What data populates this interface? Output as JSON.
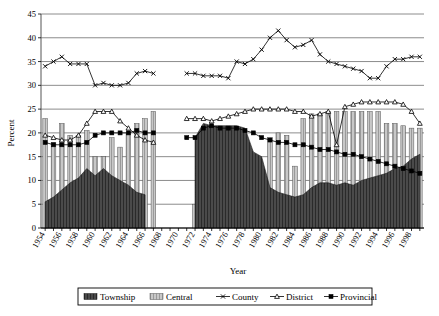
{
  "axes": {
    "y_title": "Percent",
    "x_title": "Year",
    "y_ticks": [
      "0",
      "5",
      "10",
      "15",
      "20",
      "25",
      "30",
      "35",
      "40",
      "45"
    ],
    "x_ticks": [
      "1954",
      "1956",
      "1958",
      "1960",
      "1962",
      "1964",
      "1966",
      "1968",
      "1970",
      "1972",
      "1974",
      "1976",
      "1978",
      "1980",
      "1982",
      "1984",
      "1986",
      "1988",
      "1990",
      "1992",
      "1994",
      "1996",
      "1998"
    ]
  },
  "legend": {
    "items": [
      {
        "label": "Township",
        "marker": "area-dark-swatch",
        "color": "#3a3a3a"
      },
      {
        "label": "Central",
        "marker": "bar-light-swatch",
        "color": "#bfbfbf"
      },
      {
        "label": "County",
        "marker": "line-x-marker",
        "color": "#000000"
      },
      {
        "label": "District",
        "marker": "line-triangle-marker",
        "color": "#000000"
      },
      {
        "label": "Provincial",
        "marker": "line-square-marker",
        "color": "#000000"
      }
    ]
  },
  "chart_data": {
    "type": "line",
    "title": "",
    "xlabel": "Year",
    "ylabel": "Percent",
    "xlim": [
      1954,
      1999
    ],
    "ylim": [
      0,
      45
    ],
    "ytick_step": 5,
    "grid": "horizontal",
    "legend_position": "bottom",
    "note": "Series are plotted against years 1954-1999. Township is a dark filled area series, Central is light grey vertical bars, County/District/Provincial are marker lines. Data is missing (gap) between 1966 and 1970.",
    "x": [
      1954,
      1955,
      1956,
      1957,
      1958,
      1959,
      1960,
      1961,
      1962,
      1963,
      1964,
      1965,
      1966,
      1967,
      1968,
      1969,
      1970,
      1971,
      1972,
      1973,
      1974,
      1975,
      1976,
      1977,
      1978,
      1979,
      1980,
      1981,
      1982,
      1983,
      1984,
      1985,
      1986,
      1987,
      1988,
      1989,
      1990,
      1991,
      1992,
      1993,
      1994,
      1995,
      1996,
      1997,
      1998,
      1999
    ],
    "series": [
      {
        "name": "Township",
        "type": "area",
        "color": "#3a3a3a",
        "values": [
          5.5,
          6.5,
          8.0,
          9.5,
          10.5,
          12.5,
          11.0,
          12.5,
          11.0,
          10.0,
          9.0,
          7.5,
          7.0,
          null,
          null,
          null,
          null,
          null,
          19.0,
          22.0,
          21.5,
          21.5,
          21.5,
          21.5,
          21.0,
          16.0,
          15.0,
          8.5,
          7.5,
          7.0,
          6.5,
          7.0,
          8.5,
          9.5,
          9.5,
          9.0,
          9.5,
          9.0,
          10.0,
          10.5,
          11.0,
          11.5,
          12.5,
          13.0,
          14.5,
          15.5
        ]
      },
      {
        "name": "Central",
        "type": "bar",
        "color": "#bfbfbf",
        "values": [
          23.0,
          18.0,
          22.0,
          19.5,
          19.5,
          20.5,
          15.0,
          15.0,
          19.0,
          17.0,
          20.0,
          22.0,
          23.0,
          24.5,
          null,
          null,
          null,
          null,
          5.0,
          5.0,
          5.0,
          5.0,
          5.0,
          5.0,
          5.0,
          13.0,
          9.0,
          19.0,
          20.0,
          19.5,
          13.0,
          23.0,
          24.0,
          24.0,
          24.5,
          24.5,
          24.5,
          24.5,
          24.5,
          24.5,
          24.5,
          22.0,
          22.0,
          21.5,
          21.0,
          21.0
        ]
      },
      {
        "name": "County",
        "type": "line",
        "marker": "x",
        "color": "#000000",
        "values": [
          34.0,
          35.0,
          36.0,
          34.5,
          34.5,
          34.5,
          30.0,
          30.5,
          30.0,
          30.0,
          30.5,
          32.5,
          33.0,
          32.5,
          null,
          null,
          null,
          32.5,
          32.5,
          32.0,
          32.0,
          32.0,
          31.5,
          35.0,
          34.5,
          35.5,
          37.5,
          40.0,
          41.5,
          39.5,
          38.0,
          38.5,
          39.5,
          36.5,
          35.0,
          34.5,
          34.0,
          33.5,
          33.0,
          31.5,
          31.5,
          34.0,
          35.5,
          35.5,
          36.0,
          36.0
        ]
      },
      {
        "name": "District",
        "type": "line",
        "marker": "triangle",
        "color": "#000000",
        "values": [
          19.5,
          19.0,
          18.5,
          18.5,
          19.5,
          22.0,
          24.5,
          24.5,
          24.5,
          22.5,
          21.0,
          19.5,
          18.5,
          18.0,
          null,
          null,
          null,
          23.0,
          23.0,
          23.0,
          22.5,
          23.0,
          23.5,
          24.0,
          24.5,
          25.0,
          25.0,
          25.0,
          25.0,
          25.0,
          24.5,
          24.5,
          23.5,
          24.0,
          24.5,
          17.5,
          25.5,
          26.0,
          26.5,
          26.5,
          26.5,
          26.5,
          26.5,
          26.0,
          24.5,
          22.0
        ]
      },
      {
        "name": "Provincial",
        "type": "line",
        "marker": "square",
        "color": "#000000",
        "values": [
          18.0,
          17.5,
          17.5,
          17.5,
          17.5,
          18.0,
          19.5,
          20.0,
          20.0,
          20.0,
          20.0,
          20.5,
          20.0,
          20.0,
          null,
          null,
          null,
          19.0,
          19.0,
          21.0,
          21.5,
          21.0,
          21.0,
          21.0,
          20.5,
          20.0,
          19.0,
          18.5,
          18.0,
          18.0,
          17.5,
          17.5,
          17.0,
          16.5,
          16.5,
          16.0,
          15.5,
          15.5,
          15.0,
          14.5,
          14.0,
          13.5,
          13.0,
          12.5,
          12.0,
          11.5
        ]
      }
    ]
  }
}
